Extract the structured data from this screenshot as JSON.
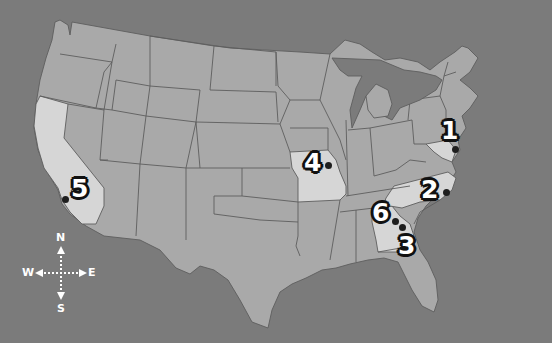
{
  "map": {
    "title": "United States locations map",
    "colors": {
      "background": "#7b7b7b",
      "state_fill": "#a9a9a9",
      "highlight_fill": "#d6d6d6",
      "border": "#5e5e5e",
      "marker_text": "#ffffff",
      "marker_outline": "#111111",
      "dot": "#1e1e1e"
    },
    "highlighted_states": [
      "California",
      "Missouri",
      "Georgia",
      "North Carolina",
      "Maryland"
    ],
    "markers": [
      {
        "label": "1",
        "state": "Maryland"
      },
      {
        "label": "2",
        "state": "North Carolina"
      },
      {
        "label": "3",
        "state": "Georgia"
      },
      {
        "label": "4",
        "state": "Missouri"
      },
      {
        "label": "5",
        "state": "California"
      },
      {
        "label": "6",
        "state": "Georgia"
      }
    ]
  },
  "compass": {
    "north": "N",
    "south": "S",
    "east": "E",
    "west": "W"
  }
}
